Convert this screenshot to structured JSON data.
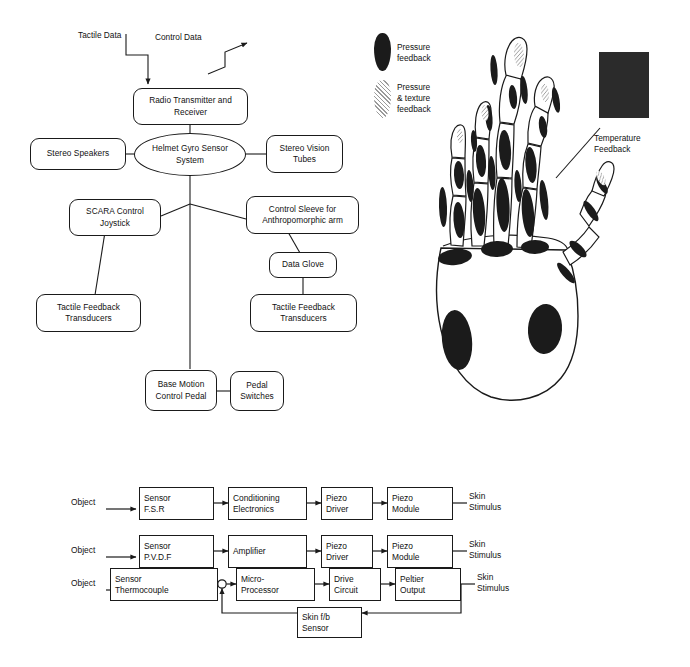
{
  "figure": {
    "background_color": "#ffffff",
    "line_color": "#1a1a1a",
    "fill_dark": "#1b1b1b"
  },
  "block_diagram": {
    "annotations": [
      {
        "name": "tactile-data-label",
        "text": "Tactile Data"
      },
      {
        "name": "control-data-label",
        "text": "Control Data"
      }
    ],
    "nodes": [
      {
        "id": "radio",
        "label": "Radio Transmitter\nand Receiver",
        "shape": "rounded-rect"
      },
      {
        "id": "helmet",
        "label": "Helmet Gyro Sensor\nSystem",
        "shape": "ellipse"
      },
      {
        "id": "speakers",
        "label": "Stereo Speakers",
        "shape": "rounded-rect"
      },
      {
        "id": "vision",
        "label": "Stereo\nVision Tubes",
        "shape": "rounded-rect"
      },
      {
        "id": "scara",
        "label": "SCARA Control\nJoystick",
        "shape": "rounded-rect"
      },
      {
        "id": "sleeve",
        "label": "Control Sleeve for\nAnthropomorphic arm",
        "shape": "rounded-rect"
      },
      {
        "id": "glove",
        "label": "Data Glove",
        "shape": "rounded-rect"
      },
      {
        "id": "tfb_left",
        "label": "Tactile Feedback\nTransducers",
        "shape": "rounded-rect"
      },
      {
        "id": "tfb_right",
        "label": "Tactile Feedback\nTransducers",
        "shape": "rounded-rect"
      },
      {
        "id": "pedal",
        "label": "Base Motion\nControl Pedal",
        "shape": "rounded-rect"
      },
      {
        "id": "switches",
        "label": "Pedal\nSwitches",
        "shape": "rounded-rect"
      }
    ]
  },
  "hand_figure": {
    "legend": [
      {
        "id": "pressure",
        "label": "Pressure\nfeedback",
        "swatch": "solid-dark-oval"
      },
      {
        "id": "pressure_texture",
        "label": "Pressure\n& texture\nfeedback",
        "swatch": "hatched-oval"
      }
    ],
    "callout": {
      "id": "temperature",
      "label": "Temperature\nFeedback",
      "swatch": "dark-rectangle"
    }
  },
  "flow_diagram": {
    "rows": [
      {
        "id": "row-fsr",
        "input_label": "Object",
        "output_label": "Skin\nStimulus",
        "blocks": [
          {
            "id": "sensor-fsr",
            "label": "Sensor\nF.S.R"
          },
          {
            "id": "conditioning-electronics",
            "label": "Conditioning\nElectronics"
          },
          {
            "id": "piezo-driver-1",
            "label": "Piezo\nDriver"
          },
          {
            "id": "piezo-module-1",
            "label": "Piezo\nModule"
          }
        ]
      },
      {
        "id": "row-pvdf",
        "input_label": "Object",
        "output_label": "Skin\nStimulus",
        "blocks": [
          {
            "id": "sensor-pvdf",
            "label": "Sensor\nP.V.D.F"
          },
          {
            "id": "amplifier",
            "label": "Amplifier"
          },
          {
            "id": "piezo-driver-2",
            "label": "Piezo\nDriver"
          },
          {
            "id": "piezo-module-2",
            "label": "Piezo\nModule"
          }
        ]
      },
      {
        "id": "row-thermocouple",
        "input_label": "Object",
        "output_label": "Skin\nStimulus",
        "blocks": [
          {
            "id": "sensor-thermocouple",
            "label": "Sensor\nThermocouple"
          },
          {
            "id": "micro-processor",
            "label": "Micro-\nProcessor"
          },
          {
            "id": "drive-circuit",
            "label": "Drive\nCircuit"
          },
          {
            "id": "peltier-output",
            "label": "Peltier\nOutput"
          }
        ],
        "feedback_block": {
          "id": "skin-fb-sensor",
          "label": "Skin f/b\nSensor"
        },
        "has_summing_junction": true
      }
    ]
  }
}
